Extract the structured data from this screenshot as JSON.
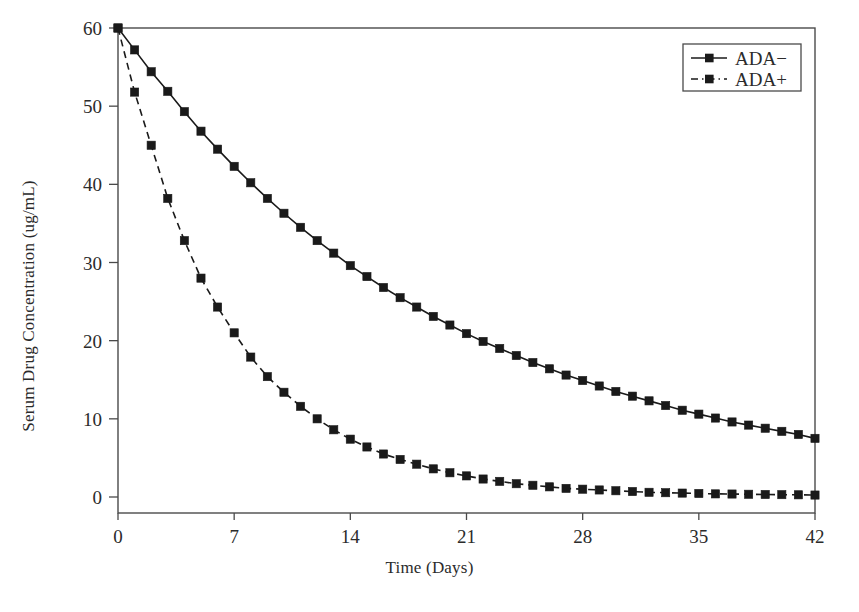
{
  "chart_data": {
    "type": "line",
    "title": "",
    "xlabel": "Time (Days)",
    "ylabel": "Serum Drug Concentration (ug/mL)",
    "xlim": [
      0,
      42
    ],
    "ylim": [
      0,
      60
    ],
    "xticks": [
      0,
      7,
      14,
      21,
      28,
      35,
      42
    ],
    "yticks": [
      0,
      10,
      20,
      30,
      40,
      50,
      60
    ],
    "xticklabels": [
      "0",
      "7",
      "14",
      "21",
      "28",
      "35",
      "42"
    ],
    "yticklabels": [
      "0",
      "10",
      "20",
      "30",
      "40",
      "50",
      "60"
    ],
    "grid": false,
    "legend_position": "top-right",
    "x": [
      0,
      1,
      2,
      3,
      4,
      5,
      6,
      7,
      8,
      9,
      10,
      11,
      12,
      13,
      14,
      15,
      16,
      17,
      18,
      19,
      20,
      21,
      22,
      23,
      24,
      25,
      26,
      27,
      28,
      29,
      30,
      31,
      32,
      33,
      34,
      35,
      36,
      37,
      38,
      39,
      40,
      41,
      42
    ],
    "series": [
      {
        "name": "ADA-",
        "linestyle": "solid",
        "marker": "square",
        "color": "#1a1a1a",
        "values": [
          60.0,
          57.2,
          54.4,
          51.9,
          49.3,
          46.8,
          44.5,
          42.3,
          40.2,
          38.2,
          36.3,
          34.5,
          32.8,
          31.2,
          29.6,
          28.2,
          26.8,
          25.5,
          24.3,
          23.1,
          22.0,
          20.9,
          19.9,
          19.0,
          18.1,
          17.2,
          16.4,
          15.6,
          14.9,
          14.2,
          13.5,
          12.9,
          12.3,
          11.7,
          11.1,
          10.6,
          10.1,
          9.6,
          9.2,
          8.8,
          8.4,
          8.0,
          7.5
        ]
      },
      {
        "name": "ADA+",
        "linestyle": "dashed",
        "marker": "square",
        "color": "#1a1a1a",
        "values": [
          60.0,
          51.8,
          45.0,
          38.2,
          32.8,
          28.0,
          24.3,
          21.0,
          17.9,
          15.4,
          13.4,
          11.6,
          10.0,
          8.6,
          7.4,
          6.4,
          5.5,
          4.8,
          4.2,
          3.6,
          3.1,
          2.7,
          2.3,
          2.0,
          1.7,
          1.5,
          1.3,
          1.1,
          1.0,
          0.9,
          0.8,
          0.7,
          0.6,
          0.55,
          0.5,
          0.45,
          0.4,
          0.38,
          0.35,
          0.32,
          0.3,
          0.28,
          0.25
        ]
      }
    ]
  },
  "legend": {
    "entries": [
      {
        "label": "ADA-",
        "style": "solid"
      },
      {
        "label": "ADA+",
        "style": "dashed"
      }
    ]
  }
}
